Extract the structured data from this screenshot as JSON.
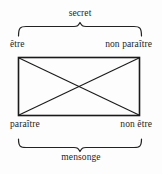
{
  "diagram": {
    "type": "semiotic-square",
    "title_top": "secret",
    "title_bottom": "mensonge",
    "corners": {
      "top_left": "être",
      "top_right": "non paraître",
      "bottom_left": "paraître",
      "bottom_right": "non être"
    },
    "colors": {
      "ink": "#1d1d1d",
      "background": "#fdfdfd"
    }
  }
}
